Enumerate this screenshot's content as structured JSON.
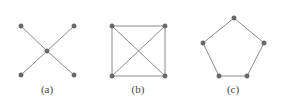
{
  "figures": [
    {
      "id": "a",
      "label": "(a)",
      "description": "star graph with 4 leaves",
      "nodes": [
        [
          21,
          26
        ],
        [
          74,
          26
        ],
        [
          47,
          51
        ],
        [
          21,
          75
        ],
        [
          74,
          75
        ]
      ],
      "edges": [
        [
          0,
          2
        ],
        [
          1,
          2
        ],
        [
          3,
          2
        ],
        [
          4,
          2
        ]
      ],
      "label_pos": [
        47,
        93
      ]
    },
    {
      "id": "b",
      "label": "(b)",
      "description": "complete graph K4 drawn as square with diagonals",
      "nodes": [
        [
          112,
          26
        ],
        [
          165,
          26
        ],
        [
          112,
          76
        ],
        [
          165,
          76
        ]
      ],
      "edges": [
        [
          0,
          1
        ],
        [
          1,
          3
        ],
        [
          3,
          2
        ],
        [
          2,
          0
        ],
        [
          0,
          3
        ],
        [
          1,
          2
        ]
      ],
      "label_pos": [
        138,
        93
      ]
    },
    {
      "id": "c",
      "label": "(c)",
      "description": "cycle graph C5 drawn as pentagon",
      "nodes": [
        [
          234,
          18
        ],
        [
          264,
          43
        ],
        [
          247,
          76
        ],
        [
          219,
          76
        ],
        [
          203,
          43
        ]
      ],
      "edges": [
        [
          0,
          1
        ],
        [
          1,
          2
        ],
        [
          2,
          3
        ],
        [
          3,
          4
        ],
        [
          4,
          0
        ]
      ],
      "label_pos": [
        233,
        93
      ]
    }
  ],
  "colors": {
    "edge": "#8a8a8a",
    "node": "#6b6b6b"
  }
}
